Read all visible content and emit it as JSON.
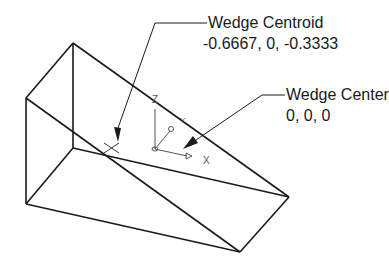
{
  "diagram": {
    "centroid_callout": {
      "title": "Wedge Centroid",
      "coordinates": "-0.6667, 0, -0.3333"
    },
    "center_callout": {
      "title": "Wedge Center",
      "coordinates": "0, 0, 0"
    },
    "axes": {
      "x": "X",
      "y": "Y",
      "z": "Z"
    },
    "colors": {
      "lines": "#1a1a1a",
      "axis": "#555555",
      "background": "#ffffff"
    }
  }
}
